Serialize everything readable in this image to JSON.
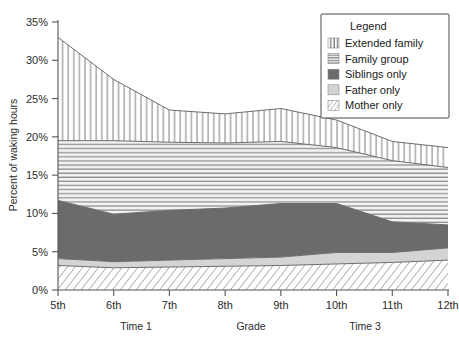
{
  "chart_data": {
    "type": "area",
    "title": "",
    "xlabel": "Grade",
    "ylabel": "Percent of waking hours",
    "ylim": [
      0,
      35
    ],
    "ytick_labels": [
      "0%",
      "5%",
      "10%",
      "15%",
      "20%",
      "25%",
      "30%",
      "35%"
    ],
    "ytick_values": [
      0,
      5,
      10,
      15,
      20,
      25,
      30,
      35
    ],
    "categories": [
      "5th",
      "6th",
      "7th",
      "8th",
      "9th",
      "10th",
      "11th",
      "12th"
    ],
    "x": [
      5,
      6,
      7,
      8,
      9,
      10,
      11,
      12
    ],
    "stacked": true,
    "grid": false,
    "legend_position": "top-right",
    "legend_title": "Legend",
    "period_annotations": [
      {
        "label": "Time 1",
        "at_category": "6th"
      },
      {
        "label": "Time 3",
        "at_category": "10th"
      }
    ],
    "series": [
      {
        "name": "Mother only",
        "pattern": "diagonal-lines",
        "color": "#ffffff",
        "values": [
          3.2,
          2.9,
          3.0,
          3.1,
          3.2,
          3.4,
          3.6,
          3.9
        ]
      },
      {
        "name": "Father only",
        "pattern": "solid-light-gray",
        "color": "#d4d4d4",
        "values": [
          0.9,
          0.8,
          0.9,
          1.0,
          1.1,
          1.5,
          1.3,
          1.6
        ]
      },
      {
        "name": "Siblings only",
        "pattern": "solid-dark-gray",
        "color": "#6b6b6b",
        "values": [
          7.6,
          6.2,
          6.5,
          6.6,
          7.0,
          6.4,
          4.0,
          3.0
        ]
      },
      {
        "name": "Family group",
        "pattern": "horizontal-lines",
        "color": "#e8e8e8",
        "values": [
          7.8,
          9.6,
          8.9,
          8.5,
          8.1,
          7.3,
          8.0,
          7.5
        ]
      },
      {
        "name": "Extended family",
        "pattern": "vertical-lines",
        "color": "#ffffff",
        "values": [
          13.5,
          8.0,
          4.2,
          3.8,
          4.3,
          3.6,
          2.5,
          2.6
        ]
      }
    ],
    "cumulative_tops": {
      "mother_only": [
        3.2,
        2.9,
        3.0,
        3.1,
        3.2,
        3.4,
        3.6,
        3.9
      ],
      "father_only": [
        4.1,
        3.7,
        3.9,
        4.1,
        4.3,
        4.9,
        4.9,
        5.5
      ],
      "siblings_only": [
        11.7,
        9.9,
        10.4,
        10.7,
        11.3,
        11.3,
        8.9,
        8.5
      ],
      "family_group": [
        19.5,
        19.5,
        19.3,
        19.2,
        19.4,
        18.6,
        16.9,
        16.0
      ],
      "extended_family": [
        33.0,
        27.5,
        23.5,
        23.0,
        23.7,
        22.2,
        19.4,
        18.6
      ]
    }
  },
  "legend": {
    "title": "Legend",
    "items": [
      {
        "label": "Extended family",
        "swatch": "vertical-lines-swatch"
      },
      {
        "label": "Family group",
        "swatch": "horizontal-lines-swatch"
      },
      {
        "label": "Siblings only",
        "swatch": "solid-dark-swatch"
      },
      {
        "label": "Father only",
        "swatch": "solid-light-swatch"
      },
      {
        "label": "Mother only",
        "swatch": "diagonal-lines-swatch"
      }
    ]
  },
  "axes": {
    "y_title": "Percent of waking hours",
    "x_title": "Grade",
    "y_ticks": [
      "35%",
      "30%",
      "25%",
      "20%",
      "15%",
      "10%",
      "5%",
      "0%"
    ],
    "x_ticks": [
      "5th",
      "6th",
      "7th",
      "8th",
      "9th",
      "10th",
      "11th",
      "12th"
    ]
  },
  "annotations": {
    "time1": "Time 1",
    "time3": "Time 3"
  },
  "colors": {
    "dark_gray": "#6b6b6b",
    "light_gray": "#d4d4d4",
    "band_stroke": "#6d6d6d",
    "axis": "#555555",
    "text": "#1a1a1a"
  }
}
